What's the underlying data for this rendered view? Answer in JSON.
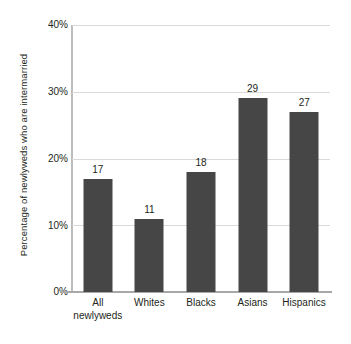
{
  "chart_data": {
    "type": "bar",
    "title": "",
    "xlabel": "",
    "ylabel": "Percentage of newlyweds who are intermarried",
    "categories": [
      "All newlyweds",
      "Whites",
      "Blacks",
      "Asians",
      "Hispanics"
    ],
    "category_labels_display": [
      "All\nnewlyweds",
      "Whites",
      "Blacks",
      "Asians",
      "Hispanics"
    ],
    "values": [
      17,
      11,
      18,
      29,
      27
    ],
    "value_labels": [
      "17",
      "11",
      "18",
      "29",
      "27"
    ],
    "ylim": [
      0,
      40
    ],
    "yticks": [
      0,
      10,
      20,
      30,
      40
    ],
    "ytick_labels": [
      "0%",
      "10%",
      "20%",
      "30%",
      "40%"
    ],
    "grid": true,
    "legend": null,
    "colors": {
      "bar": "#464646",
      "gridline": "#d9d9d9",
      "axis": "#a8a8a8",
      "text": "#231f20",
      "background": "#ffffff"
    }
  }
}
